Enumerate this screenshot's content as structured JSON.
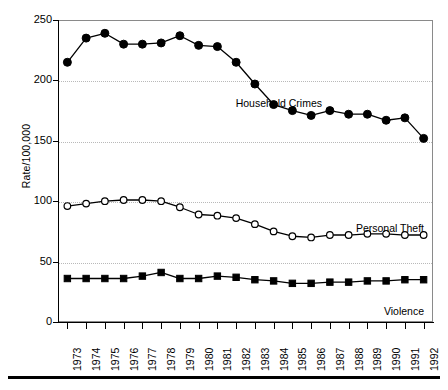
{
  "chart_data": {
    "type": "line",
    "title": "",
    "xlabel": "",
    "ylabel": "Rate/100,000",
    "ylim": [
      0,
      250
    ],
    "yticks": [
      0,
      50,
      100,
      150,
      200,
      250
    ],
    "ytick_labels": [
      "0",
      "50",
      "100",
      "150",
      "200",
      "250"
    ],
    "grid": "horizontal dotted at 50,100,150,200",
    "legend": "inline annotations to the right of each series",
    "categories": [
      "1973",
      "1974",
      "1975",
      "1976",
      "1977",
      "1978",
      "1979",
      "1980",
      "1981",
      "1982",
      "1983",
      "1984",
      "1985",
      "1986",
      "1987",
      "1988",
      "1989",
      "1990",
      "1991",
      "1992"
    ],
    "series": [
      {
        "name": "Household Crimes",
        "marker": "filled-circle",
        "label_x_year": "1986",
        "values": [
          215,
          235,
          239,
          230,
          230,
          231,
          237,
          229,
          228,
          215,
          197,
          180,
          175,
          171,
          175,
          172,
          172,
          167,
          169,
          152
        ]
      },
      {
        "name": "Personal Theft",
        "marker": "open-circle",
        "label_x_year": "1989",
        "values": [
          96,
          98,
          100,
          101,
          101,
          100,
          95,
          89,
          88,
          86,
          81,
          75,
          71,
          70,
          72,
          72,
          73,
          73,
          72,
          72
        ]
      },
      {
        "name": "Violence",
        "marker": "filled-square",
        "label_x_year": "1990",
        "values": [
          36,
          36,
          36,
          36,
          38,
          41,
          36,
          36,
          38,
          37,
          35,
          34,
          32,
          32,
          33,
          33,
          34,
          34,
          35,
          35
        ]
      }
    ],
    "colors": {
      "line": "#000000",
      "marker_fill": "#000000",
      "marker_open_fill": "#ffffff",
      "grid": "#b9b9b9",
      "frame": "#8a8a8a",
      "axis": "#000000",
      "text": "#000000"
    }
  },
  "annotations": {
    "household_crimes": "Household Crimes",
    "personal_theft": "Personal Theft",
    "violence": "Violence"
  }
}
